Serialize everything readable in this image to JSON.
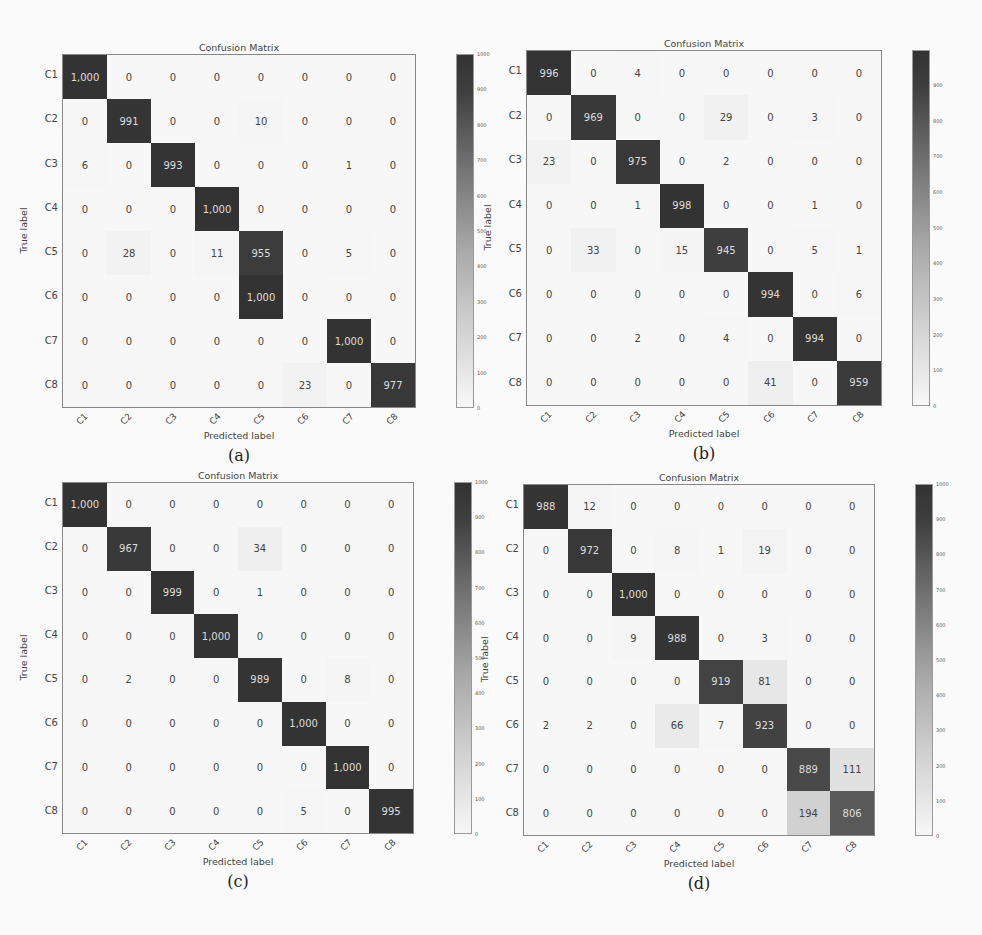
{
  "chart_data": [
    {
      "type": "heatmap",
      "caption": "(a)",
      "title": "Confusion Matrix",
      "xlabel": "Predicted label",
      "ylabel": "True label",
      "rows": [
        "C1",
        "C2",
        "C3",
        "C4",
        "C5",
        "C6",
        "C7",
        "C8"
      ],
      "cols": [
        "C1",
        "C2",
        "C3",
        "C4",
        "C5",
        "C6",
        "C7",
        "C8"
      ],
      "values": [
        [
          1000,
          0,
          0,
          0,
          0,
          0,
          0,
          0
        ],
        [
          0,
          991,
          0,
          0,
          10,
          0,
          0,
          0
        ],
        [
          6,
          0,
          993,
          0,
          0,
          0,
          1,
          0
        ],
        [
          0,
          0,
          0,
          1000,
          0,
          0,
          0,
          0
        ],
        [
          0,
          28,
          0,
          11,
          955,
          0,
          5,
          0
        ],
        [
          0,
          0,
          0,
          0,
          1000,
          0,
          0,
          0
        ],
        [
          0,
          0,
          0,
          0,
          0,
          0,
          1000,
          0
        ],
        [
          0,
          0,
          0,
          0,
          0,
          23,
          0,
          977
        ]
      ],
      "labels": [
        [
          "1,000",
          "0",
          "0",
          "0",
          "0",
          "0",
          "0",
          "0"
        ],
        [
          "0",
          "991",
          "0",
          "0",
          "10",
          "0",
          "0",
          "0"
        ],
        [
          "6",
          "0",
          "993",
          "0",
          "0",
          "0",
          "1",
          "0"
        ],
        [
          "0",
          "0",
          "0",
          "1,000",
          "0",
          "0",
          "0",
          "0"
        ],
        [
          "0",
          "28",
          "0",
          "11",
          "955",
          "0",
          "5",
          "0"
        ],
        [
          "0",
          "0",
          "0",
          "0",
          "1,000",
          "0",
          "0",
          "0"
        ],
        [
          "0",
          "0",
          "0",
          "0",
          "0",
          "0",
          "1,000",
          "0"
        ],
        [
          "0",
          "0",
          "0",
          "0",
          "0",
          "23",
          "0",
          "977"
        ]
      ],
      "colorbar": {
        "min": 0,
        "max": 1000,
        "ticks": [
          "1000",
          "900",
          "800",
          "700",
          "600",
          "500",
          "400",
          "300",
          "200",
          "100",
          "0"
        ]
      }
    },
    {
      "type": "heatmap",
      "caption": "(b)",
      "title": "Confusion Matrix",
      "xlabel": "Predicted label",
      "ylabel": "True label",
      "rows": [
        "C1",
        "C2",
        "C3",
        "C4",
        "C5",
        "C6",
        "C7",
        "C8"
      ],
      "cols": [
        "C1",
        "C2",
        "C3",
        "C4",
        "C5",
        "C6",
        "C7",
        "C8"
      ],
      "values": [
        [
          996,
          0,
          4,
          0,
          0,
          0,
          0,
          0
        ],
        [
          0,
          969,
          0,
          0,
          29,
          0,
          3,
          0
        ],
        [
          23,
          0,
          975,
          0,
          2,
          0,
          0,
          0
        ],
        [
          0,
          0,
          1,
          998,
          0,
          0,
          1,
          0
        ],
        [
          0,
          33,
          0,
          15,
          945,
          0,
          5,
          1
        ],
        [
          0,
          0,
          0,
          0,
          0,
          994,
          0,
          6
        ],
        [
          0,
          0,
          2,
          0,
          4,
          0,
          994,
          0
        ],
        [
          0,
          0,
          0,
          0,
          0,
          41,
          0,
          959
        ]
      ],
      "labels": [
        [
          "996",
          "0",
          "4",
          "0",
          "0",
          "0",
          "0",
          "0"
        ],
        [
          "0",
          "969",
          "0",
          "0",
          "29",
          "0",
          "3",
          "0"
        ],
        [
          "23",
          "0",
          "975",
          "0",
          "2",
          "0",
          "0",
          "0"
        ],
        [
          "0",
          "0",
          "1",
          "998",
          "0",
          "0",
          "1",
          "0"
        ],
        [
          "0",
          "33",
          "0",
          "15",
          "945",
          "0",
          "5",
          "1"
        ],
        [
          "0",
          "0",
          "0",
          "0",
          "0",
          "994",
          "0",
          "6"
        ],
        [
          "0",
          "0",
          "2",
          "0",
          "4",
          "0",
          "994",
          "0"
        ],
        [
          "0",
          "0",
          "0",
          "0",
          "0",
          "41",
          "0",
          "959"
        ]
      ],
      "colorbar": {
        "min": 0,
        "max": 998,
        "ticks": [
          "",
          "900",
          "800",
          "700",
          "600",
          "500",
          "400",
          "300",
          "200",
          "100",
          "0"
        ]
      }
    },
    {
      "type": "heatmap",
      "caption": "(c)",
      "title": "Confusion Matrix",
      "xlabel": "Predicted label",
      "ylabel": "True label",
      "rows": [
        "C1",
        "C2",
        "C3",
        "C4",
        "C5",
        "C6",
        "C7",
        "C8"
      ],
      "cols": [
        "C1",
        "C2",
        "C3",
        "C4",
        "C5",
        "C6",
        "C7",
        "C8"
      ],
      "values": [
        [
          1000,
          0,
          0,
          0,
          0,
          0,
          0,
          0
        ],
        [
          0,
          967,
          0,
          0,
          34,
          0,
          0,
          0
        ],
        [
          0,
          0,
          999,
          0,
          1,
          0,
          0,
          0
        ],
        [
          0,
          0,
          0,
          1000,
          0,
          0,
          0,
          0
        ],
        [
          0,
          2,
          0,
          0,
          989,
          0,
          8,
          0
        ],
        [
          0,
          0,
          0,
          0,
          0,
          1000,
          0,
          0
        ],
        [
          0,
          0,
          0,
          0,
          0,
          0,
          1000,
          0
        ],
        [
          0,
          0,
          0,
          0,
          0,
          5,
          0,
          995
        ]
      ],
      "labels": [
        [
          "1,000",
          "0",
          "0",
          "0",
          "0",
          "0",
          "0",
          "0"
        ],
        [
          "0",
          "967",
          "0",
          "0",
          "34",
          "0",
          "0",
          "0"
        ],
        [
          "0",
          "0",
          "999",
          "0",
          "1",
          "0",
          "0",
          "0"
        ],
        [
          "0",
          "0",
          "0",
          "1,000",
          "0",
          "0",
          "0",
          "0"
        ],
        [
          "0",
          "2",
          "0",
          "0",
          "989",
          "0",
          "8",
          "0"
        ],
        [
          "0",
          "0",
          "0",
          "0",
          "0",
          "1,000",
          "0",
          "0"
        ],
        [
          "0",
          "0",
          "0",
          "0",
          "0",
          "0",
          "1,000",
          "0"
        ],
        [
          "0",
          "0",
          "0",
          "0",
          "0",
          "5",
          "0",
          "995"
        ]
      ],
      "colorbar": {
        "min": 0,
        "max": 1000,
        "ticks": [
          "1000",
          "900",
          "800",
          "700",
          "600",
          "500",
          "400",
          "300",
          "200",
          "100",
          "0"
        ]
      }
    },
    {
      "type": "heatmap",
      "caption": "(d)",
      "title": "Confusion Matrix",
      "xlabel": "Predicted label",
      "ylabel": "True label",
      "rows": [
        "C1",
        "C2",
        "C3",
        "C4",
        "C5",
        "C6",
        "C7",
        "C8"
      ],
      "cols": [
        "C1",
        "C2",
        "C3",
        "C4",
        "C5",
        "C6",
        "C7",
        "C8"
      ],
      "values": [
        [
          988,
          12,
          0,
          0,
          0,
          0,
          0,
          0
        ],
        [
          0,
          972,
          0,
          8,
          1,
          19,
          0,
          0
        ],
        [
          0,
          0,
          1000,
          0,
          0,
          0,
          0,
          0
        ],
        [
          0,
          0,
          9,
          988,
          0,
          3,
          0,
          0
        ],
        [
          0,
          0,
          0,
          0,
          919,
          81,
          0,
          0
        ],
        [
          2,
          2,
          0,
          66,
          7,
          923,
          0,
          0
        ],
        [
          0,
          0,
          0,
          0,
          0,
          0,
          889,
          111
        ],
        [
          0,
          0,
          0,
          0,
          0,
          0,
          194,
          806
        ]
      ],
      "labels": [
        [
          "988",
          "12",
          "0",
          "0",
          "0",
          "0",
          "0",
          "0"
        ],
        [
          "0",
          "972",
          "0",
          "8",
          "1",
          "19",
          "0",
          "0"
        ],
        [
          "0",
          "0",
          "1,000",
          "0",
          "0",
          "0",
          "0",
          "0"
        ],
        [
          "0",
          "0",
          "9",
          "988",
          "0",
          "3",
          "0",
          "0"
        ],
        [
          "0",
          "0",
          "0",
          "0",
          "919",
          "81",
          "0",
          "0"
        ],
        [
          "2",
          "2",
          "0",
          "66",
          "7",
          "923",
          "0",
          "0"
        ],
        [
          "0",
          "0",
          "0",
          "0",
          "0",
          "0",
          "889",
          "111"
        ],
        [
          "0",
          "0",
          "0",
          "0",
          "0",
          "0",
          "194",
          "806"
        ]
      ],
      "colorbar": {
        "min": 0,
        "max": 1000,
        "ticks": [
          "1000",
          "900",
          "800",
          "700",
          "600",
          "500",
          "400",
          "300",
          "200",
          "100",
          "0"
        ]
      }
    }
  ]
}
